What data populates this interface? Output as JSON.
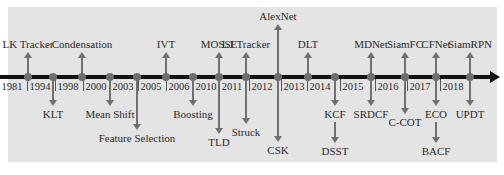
{
  "diagram": {
    "type": "timeline",
    "axis_color": "#111111",
    "node_color": "#6e6e6e",
    "arrow_color": "#707070",
    "background": "#e4e4e4",
    "years": [
      {
        "label": "1981",
        "x": 12
      },
      {
        "label": "1994",
        "x": 40
      },
      {
        "label": "1998",
        "x": 68
      },
      {
        "label": "2000",
        "x": 96
      },
      {
        "label": "2003",
        "x": 123
      },
      {
        "label": "2005",
        "x": 151
      },
      {
        "label": "2006",
        "x": 179
      },
      {
        "label": "2010",
        "x": 206
      },
      {
        "label": "2011",
        "x": 232
      },
      {
        "label": "2012",
        "x": 262
      },
      {
        "label": "2013",
        "x": 294
      },
      {
        "label": "2014",
        "x": 320
      },
      {
        "label": "2015",
        "x": 353
      },
      {
        "label": "2016",
        "x": 388
      },
      {
        "label": "2017",
        "x": 420
      },
      {
        "label": "2018",
        "x": 453
      }
    ],
    "events": [
      {
        "x": 28,
        "up": "LK Tracker",
        "up_len": 20,
        "down": null
      },
      {
        "x": 53,
        "up": null,
        "down": "KLT",
        "down_len": 24
      },
      {
        "x": 82,
        "up": "Condensation",
        "up_len": 20,
        "down": null
      },
      {
        "x": 110,
        "up": null,
        "down": "Mean Shift",
        "down_len": 24
      },
      {
        "x": 137,
        "up": null,
        "down": "Feature Selection",
        "down_len": 48
      },
      {
        "x": 166,
        "up": "IVT",
        "up_len": 20,
        "down": null
      },
      {
        "x": 193,
        "up": null,
        "down": "Boosting",
        "down_len": 24
      },
      {
        "x": 219,
        "up": "MOSSE",
        "up_len": 20,
        "down": "TLD",
        "down_len": 52
      },
      {
        "x": 246,
        "up": "L1 Tracker",
        "up_len": 20,
        "down": "Struck",
        "down_len": 42
      },
      {
        "x": 278,
        "up": "AlexNet",
        "up_len": 48,
        "down": "CSK",
        "down_len": 60
      },
      {
        "x": 308,
        "up": "DLT",
        "up_len": 20,
        "down": null
      },
      {
        "x": 335,
        "up": null,
        "down": "KCF",
        "down_len": 24,
        "down2": "DSST"
      },
      {
        "x": 371,
        "up": "MDNet",
        "up_len": 20,
        "down": "SRDCF",
        "down_len": 24
      },
      {
        "x": 405,
        "up": "SiamFC",
        "up_len": 20,
        "down": "C-COT",
        "down_len": 32
      },
      {
        "x": 436,
        "up": "CFNet",
        "up_len": 20,
        "down": "ECO",
        "down_len": 24,
        "down2": "BACF"
      },
      {
        "x": 470,
        "up": "SiamRPN",
        "up_len": 20,
        "down": "UPDT",
        "down_len": 24
      }
    ]
  }
}
